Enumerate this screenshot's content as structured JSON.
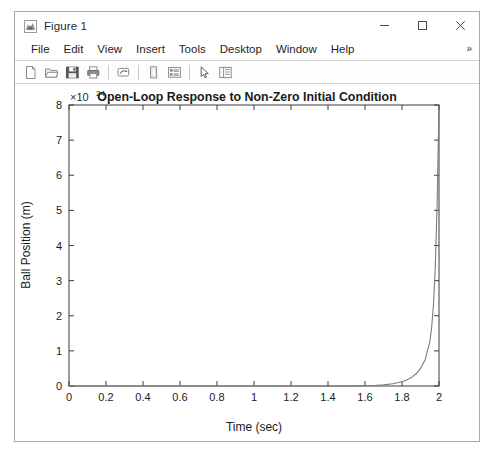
{
  "top_strip": {
    "text": " "
  },
  "window": {
    "title": "Figure 1",
    "icon": "matlab-membrane-icon",
    "controls": {
      "minimize": "minimize-icon",
      "maximize": "maximize-icon",
      "close": "close-icon"
    }
  },
  "menubar": {
    "items": [
      {
        "label": "File"
      },
      {
        "label": "Edit"
      },
      {
        "label": "View"
      },
      {
        "label": "Insert"
      },
      {
        "label": "Tools"
      },
      {
        "label": "Desktop"
      },
      {
        "label": "Window"
      },
      {
        "label": "Help"
      }
    ],
    "overflow": "»"
  },
  "toolbar": {
    "buttons": [
      {
        "name": "new-figure-icon",
        "tooltip": "New Figure"
      },
      {
        "name": "open-file-icon",
        "tooltip": "Open File"
      },
      {
        "name": "save-figure-icon",
        "tooltip": "Save Figure"
      },
      {
        "name": "print-figure-icon",
        "tooltip": "Print Figure"
      },
      {
        "name": "link-plot-icon",
        "tooltip": "Link Plot"
      },
      {
        "name": "insert-colorbar-icon",
        "tooltip": "Insert Colorbar"
      },
      {
        "name": "insert-legend-icon",
        "tooltip": "Insert Legend"
      },
      {
        "name": "edit-plot-icon",
        "tooltip": "Edit Plot"
      },
      {
        "name": "show-plot-tools-icon",
        "tooltip": "Show Plot Tools and Dock Figure"
      }
    ]
  },
  "chart_data": {
    "type": "line",
    "title": "Open-Loop Response to Non-Zero Initial Condition",
    "xlabel": "Time (sec)",
    "ylabel": "Ball Position (m)",
    "xlim": [
      0,
      2
    ],
    "ylim": [
      0,
      8
    ],
    "xticks": [
      0,
      0.2,
      0.4,
      0.6,
      0.8,
      1,
      1.2,
      1.4,
      1.6,
      1.8,
      2
    ],
    "xticklabels": [
      "0",
      "0.2",
      "0.4",
      "0.6",
      "0.8",
      "1",
      "1.2",
      "1.4",
      "1.6",
      "1.8",
      "2"
    ],
    "yticks": [
      0,
      1,
      2,
      3,
      4,
      5,
      6,
      7,
      8
    ],
    "yticklabels": [
      "0",
      "1",
      "2",
      "3",
      "4",
      "5",
      "6",
      "7",
      "8"
    ],
    "y_exponent_label": "×10",
    "y_exponent_power": "24",
    "y_scale_factor": 1e+24,
    "grid": false,
    "legend": false,
    "box": true,
    "line_color": "#7a7a7a",
    "series": [
      {
        "name": "Ball Position",
        "x": [
          0,
          0.1,
          0.2,
          0.3,
          0.4,
          0.5,
          0.6,
          0.7,
          0.8,
          0.9,
          1.0,
          1.1,
          1.2,
          1.3,
          1.4,
          1.5,
          1.55,
          1.6,
          1.65,
          1.7,
          1.75,
          1.8,
          1.825,
          1.85,
          1.875,
          1.9,
          1.925,
          1.95,
          1.96,
          1.97,
          1.98,
          1.99,
          2.0
        ],
        "y": [
          0,
          0,
          0,
          0,
          0,
          0,
          0,
          0,
          0,
          0,
          0,
          0,
          0,
          0,
          0,
          0.002,
          0.004,
          0.008,
          0.016,
          0.032,
          0.062,
          0.12,
          0.17,
          0.24,
          0.34,
          0.5,
          0.75,
          1.25,
          1.65,
          2.3,
          3.4,
          5.2,
          8.0
        ]
      }
    ]
  }
}
